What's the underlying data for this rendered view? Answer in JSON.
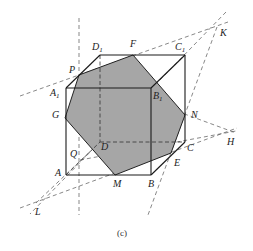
{
  "figure": {
    "caption": "(c)",
    "section_color": "#a6a6a6",
    "labels": {
      "D1": {
        "main": "D",
        "sub": "1"
      },
      "F": {
        "main": "F"
      },
      "C1": {
        "main": "C",
        "sub": "1"
      },
      "K": {
        "main": "K"
      },
      "P": {
        "main": "P"
      },
      "A1": {
        "main": "A",
        "sub": "1"
      },
      "B1": {
        "main": "B",
        "sub": "1"
      },
      "G": {
        "main": "G"
      },
      "N": {
        "main": "N"
      },
      "H": {
        "main": "H"
      },
      "Q": {
        "main": "Q"
      },
      "D": {
        "main": "D"
      },
      "C": {
        "main": "C"
      },
      "E": {
        "main": "E"
      },
      "A": {
        "main": "A"
      },
      "M": {
        "main": "M"
      },
      "B": {
        "main": "B"
      },
      "L": {
        "main": "L"
      }
    }
  }
}
